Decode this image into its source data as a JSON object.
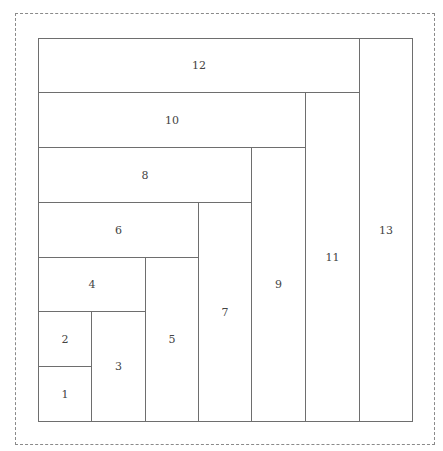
{
  "diagram": {
    "type": "nested L-shaped rectangle partition",
    "cells": [
      {
        "label": "1",
        "x": 38,
        "y": 366,
        "w": 54,
        "h": 56
      },
      {
        "label": "2",
        "x": 38,
        "y": 311,
        "w": 54,
        "h": 56
      },
      {
        "label": "3",
        "x": 91,
        "y": 311,
        "w": 55,
        "h": 111
      },
      {
        "label": "4",
        "x": 38,
        "y": 257,
        "w": 108,
        "h": 55
      },
      {
        "label": "5",
        "x": 145,
        "y": 257,
        "w": 54,
        "h": 165
      },
      {
        "label": "6",
        "x": 38,
        "y": 202,
        "w": 161,
        "h": 56
      },
      {
        "label": "7",
        "x": 198,
        "y": 202,
        "w": 54,
        "h": 220
      },
      {
        "label": "8",
        "x": 38,
        "y": 147,
        "w": 214,
        "h": 56
      },
      {
        "label": "9",
        "x": 251,
        "y": 147,
        "w": 55,
        "h": 275
      },
      {
        "label": "10",
        "x": 38,
        "y": 92,
        "w": 268,
        "h": 56
      },
      {
        "label": "11",
        "x": 305,
        "y": 92,
        "w": 55,
        "h": 330
      },
      {
        "label": "12",
        "x": 38,
        "y": 38,
        "w": 322,
        "h": 55
      },
      {
        "label": "13",
        "x": 359,
        "y": 38,
        "w": 54,
        "h": 384
      }
    ]
  }
}
